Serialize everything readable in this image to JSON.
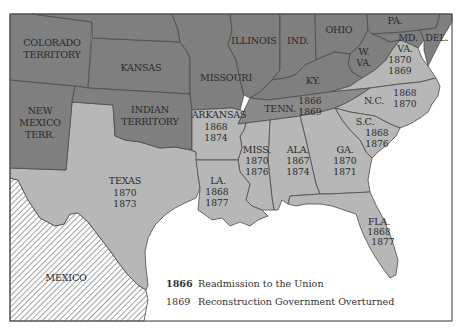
{
  "map": {
    "colors": {
      "union_states": "#8e8e8e",
      "former_confederate_states": "#b7b7b7",
      "tennessee": "#8a8a8a",
      "water": "#ffffff",
      "mexico_hatch": "#6e6e6e"
    },
    "regions": {
      "colorado": {
        "line1": "COLORADO",
        "line2": "TERRITORY"
      },
      "kansas": {
        "label": "KANSAS"
      },
      "missouri": {
        "label": "MISSOURI"
      },
      "illinois": {
        "label": "ILLINOIS"
      },
      "indiana": {
        "label": "IND."
      },
      "ohio": {
        "label": "OHIO"
      },
      "pennsylvania": {
        "label": "PA."
      },
      "maryland": {
        "label": "MD."
      },
      "delaware": {
        "label": "DEL."
      },
      "west_virginia": {
        "line1": "W.",
        "line2": "VA."
      },
      "kentucky": {
        "label": "KY."
      },
      "new_mexico": {
        "line1": "NEW",
        "line2": "MEXICO",
        "line3": "TERR."
      },
      "indian_territory": {
        "line1": "INDIAN",
        "line2": "TERRITORY"
      },
      "mexico": {
        "label": "MEXICO"
      }
    },
    "states": {
      "virginia": {
        "label": "VA.",
        "readmission": "1870",
        "overturned": "1869"
      },
      "north_carolina": {
        "label": "N.C.",
        "readmission": "1868",
        "overturned": "1870"
      },
      "tennessee": {
        "label": "TENN.",
        "readmission": "1866",
        "overturned": "1869"
      },
      "south_carolina": {
        "label": "S.C.",
        "readmission": "1868",
        "overturned": "1876"
      },
      "arkansas": {
        "label": "ARKANSAS",
        "readmission": "1868",
        "overturned": "1874"
      },
      "mississippi": {
        "label": "MISS.",
        "readmission": "1870",
        "overturned": "1876"
      },
      "alabama": {
        "label": "ALA.",
        "readmission": "1867",
        "overturned": "1874"
      },
      "georgia": {
        "label": "GA.",
        "readmission": "1870",
        "overturned": "1871"
      },
      "texas": {
        "label": "TEXAS",
        "readmission": "1870",
        "overturned": "1873"
      },
      "louisiana": {
        "label": "LA.",
        "readmission": "1868",
        "overturned": "1877"
      },
      "florida": {
        "label": "FLA.",
        "readmission": "1868",
        "overturned": "1877"
      }
    },
    "legend": {
      "items": [
        {
          "year": "1866",
          "text": "Readmission to the Union"
        },
        {
          "year": "1869",
          "text": "Reconstruction Government Overturned"
        }
      ]
    }
  }
}
